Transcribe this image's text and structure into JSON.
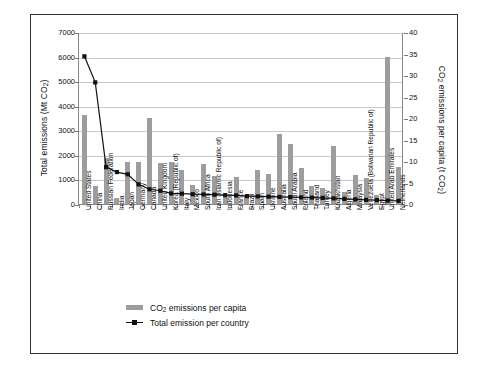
{
  "figure": {
    "border_color": "#333333",
    "background": "#ffffff"
  },
  "chart_data": {
    "type": "bar",
    "title": "",
    "subtitle": "",
    "xlabel": "",
    "ylabel": "Total emissions (Mt CO2)",
    "y2label": "CO2 emissions per capita (t CO2)",
    "grid": true,
    "legend_position": "bottom-left",
    "ylim": [
      0,
      7000
    ],
    "y2lim": [
      0,
      40
    ],
    "yticks": [
      0,
      1000,
      2000,
      3000,
      4000,
      5000,
      6000,
      7000
    ],
    "y2ticks": [
      0,
      5,
      10,
      15,
      20,
      25,
      30,
      35,
      40
    ],
    "categories": [
      "United States",
      "China",
      "Russian Federation",
      "India",
      "Japan",
      "Germany",
      "Canada",
      "United Kingdom",
      "Korea (Republic of)",
      "Italy",
      "Mexico",
      "South Africa",
      "Iran (Islamic Republic of)",
      "Indonesia",
      "France",
      "Brazil",
      "Spain",
      "Ukraine",
      "Australia",
      "Saudi Arabia",
      "Poland",
      "Thailand",
      "Turkey",
      "Kazakhstan",
      "Algeria",
      "Malaysia",
      "Venezuela (Bolivarian Republic of)",
      "Egypt",
      "United Arab Emirates",
      "Netherlands"
    ],
    "series": [
      {
        "name": "CO2 emissions per capita",
        "type": "bar",
        "axis": "right",
        "unit": "t CO2",
        "color": "#9d9d9d",
        "values": [
          20.6,
          4.3,
          10.6,
          1.3,
          9.8,
          9.8,
          20.0,
          9.6,
          9.7,
          7.8,
          4.4,
          9.3,
          6.6,
          1.7,
          6.2,
          1.9,
          7.9,
          7.0,
          16.3,
          13.9,
          8.3,
          4.3,
          3.7,
          13.5,
          2.8,
          6.7,
          6.1,
          2.2,
          34.1,
          8.7
        ]
      },
      {
        "name": "Total emission per country",
        "type": "line",
        "axis": "left",
        "unit": "Mt CO2",
        "color": "#111111",
        "marker": "square",
        "values": [
          6050,
          4990,
          1540,
          1340,
          1250,
          840,
          640,
          580,
          470,
          460,
          440,
          430,
          420,
          400,
          390,
          360,
          350,
          340,
          330,
          320,
          310,
          300,
          290,
          270,
          250,
          230,
          210,
          200,
          180,
          170
        ]
      }
    ]
  },
  "legend": {
    "items": [
      {
        "label": "CO2 emissions per capita",
        "marker": "bar",
        "color": "#9d9d9d"
      },
      {
        "label": "Total emission per country",
        "marker": "line-square",
        "color": "#111111"
      }
    ]
  }
}
